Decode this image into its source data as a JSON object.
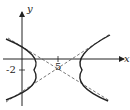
{
  "diagram": {
    "type": "hyperbola-graph",
    "axes": {
      "x_label": "x",
      "y_label": "y"
    },
    "ticks": {
      "x_tick": "5",
      "y_tick": "-2"
    },
    "center": [
      5,
      -2
    ],
    "orientation": "horizontal",
    "asymptotes": "dashed",
    "colors": {
      "curve": "#222222",
      "axis": "#222222",
      "asymptote": "#555555"
    }
  }
}
